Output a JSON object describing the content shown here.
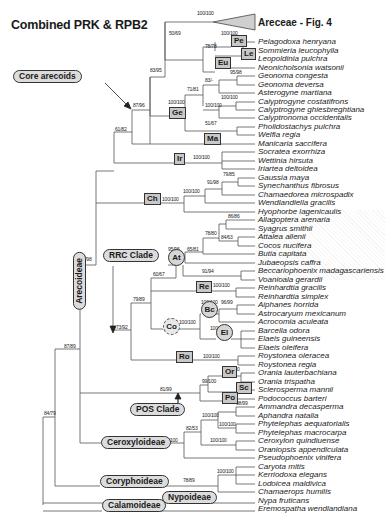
{
  "figure": {
    "title": "Combined PRK & RPB2",
    "collapsed_clade_label": "Areceae - Fig. 4",
    "collapsed_clade_support": "100/100"
  },
  "taxa": [
    {
      "name": "Pelagodoxa henryana",
      "y": 42
    },
    {
      "name": "Sommieria leucophylla",
      "y": 51
    },
    {
      "name": "Leopoldinia pulchra",
      "y": 59
    },
    {
      "name": "Neonicholsonia watsonii",
      "y": 68
    },
    {
      "name": "Geonoma congesta",
      "y": 76
    },
    {
      "name": "Geonoma deversa",
      "y": 85
    },
    {
      "name": "Asterogyne martiana",
      "y": 93
    },
    {
      "name": "Calyptrogyne costatifrons",
      "y": 102
    },
    {
      "name": "Calyptrogyne ghiesbreghtiana",
      "y": 110
    },
    {
      "name": "Calyptronoma occidentalis",
      "y": 118
    },
    {
      "name": "Pholidostachys pulchra",
      "y": 127
    },
    {
      "name": "Welfia regia",
      "y": 135
    },
    {
      "name": "Manicaria saccifera",
      "y": 144
    },
    {
      "name": "Socratea exorrhiza",
      "y": 152
    },
    {
      "name": "Wettinia hirsuta",
      "y": 161
    },
    {
      "name": "Iriartea deltoidea",
      "y": 169
    },
    {
      "name": "Gaussia maya",
      "y": 178
    },
    {
      "name": "Synechanthus fibrosus",
      "y": 186
    },
    {
      "name": "Chamaedorea microspadix",
      "y": 195
    },
    {
      "name": "Wendlandiella gracilis",
      "y": 203
    },
    {
      "name": "Hyophorbe lagenicaulis",
      "y": 212
    },
    {
      "name": "Allagoptera arenaria",
      "y": 220
    },
    {
      "name": "Syagrus smithii",
      "y": 229
    },
    {
      "name": "Attalea allenii",
      "y": 237
    },
    {
      "name": "Cocos nucifera",
      "y": 246
    },
    {
      "name": "Butia capitata",
      "y": 254
    },
    {
      "name": "Jubaeopsis caffra",
      "y": 263
    },
    {
      "name": "Beccariophoenix madagascariensis",
      "y": 271
    },
    {
      "name": "Voanioala gerardii",
      "y": 280
    },
    {
      "name": "Reinhardtia gracilis",
      "y": 288
    },
    {
      "name": "Reinhardtia simplex",
      "y": 297
    },
    {
      "name": "Aiphanes horrida",
      "y": 305
    },
    {
      "name": "Astrocaryum mexicanum",
      "y": 314
    },
    {
      "name": "Acrocomia aculeata",
      "y": 322
    },
    {
      "name": "Barcella odora",
      "y": 331
    },
    {
      "name": "Elaeis guineensis",
      "y": 339
    },
    {
      "name": "Elaeis oleifera",
      "y": 348
    },
    {
      "name": "Roystonea oleracea",
      "y": 356
    },
    {
      "name": "Roystonea regia",
      "y": 365
    },
    {
      "name": "Orania lauterbachiana",
      "y": 373
    },
    {
      "name": "Orania trispatha",
      "y": 382
    },
    {
      "name": "Sclerosperma mannii",
      "y": 390
    },
    {
      "name": "Podococcus barteri",
      "y": 399
    },
    {
      "name": "Ammandra decasperma",
      "y": 407
    },
    {
      "name": "Aphandra natalia",
      "y": 416
    },
    {
      "name": "Phytelephas aequatorialis",
      "y": 424
    },
    {
      "name": "Phytelephas macrocarpa",
      "y": 433
    },
    {
      "name": "Ceroxylon quindiuense",
      "y": 441
    },
    {
      "name": "Oraniopsis appendiculata",
      "y": 450
    },
    {
      "name": "Pseudophoenix vinifera",
      "y": 458
    },
    {
      "name": "Caryota mitis",
      "y": 467
    },
    {
      "name": "Kerriodoxa elegans",
      "y": 475
    },
    {
      "name": "Lodoicea maldivica",
      "y": 484
    },
    {
      "name": "Chamaerops humilis",
      "y": 492
    },
    {
      "name": "Nypa fruticans",
      "y": 501
    },
    {
      "name": "Eremospatha wendlandiana",
      "y": 509
    }
  ],
  "support_values": [
    {
      "text": "100/100",
      "x": 197,
      "y": 14
    },
    {
      "text": "50/69",
      "x": 169,
      "y": 34
    },
    {
      "text": "100/100",
      "x": 221,
      "y": 34
    },
    {
      "text": "78/78",
      "x": 205,
      "y": 47
    },
    {
      "text": "83/95",
      "x": 150,
      "y": 71
    },
    {
      "text": "95/98",
      "x": 230,
      "y": 73
    },
    {
      "text": "83/-",
      "x": 205,
      "y": 81
    },
    {
      "text": "71/81",
      "x": 187,
      "y": 90
    },
    {
      "text": "100/100",
      "x": 221,
      "y": 98
    },
    {
      "text": "100/100",
      "x": 168,
      "y": 103
    },
    {
      "text": "100/100",
      "x": 205,
      "y": 106
    },
    {
      "text": "87/96",
      "x": 133,
      "y": 106
    },
    {
      "text": "51/67",
      "x": 205,
      "y": 124
    },
    {
      "text": "61/82",
      "x": 115,
      "y": 130
    },
    {
      "text": "100/100",
      "x": 193,
      "y": 158
    },
    {
      "text": "79/85",
      "x": 223,
      "y": 175
    },
    {
      "text": "91/98",
      "x": 207,
      "y": 183
    },
    {
      "text": "100/100",
      "x": 183,
      "y": 192
    },
    {
      "text": "100/100",
      "x": 162,
      "y": 200
    },
    {
      "text": "86/86",
      "x": 228,
      "y": 217
    },
    {
      "text": "78/80",
      "x": 205,
      "y": 234
    },
    {
      "text": "84/63",
      "x": 221,
      "y": 238
    },
    {
      "text": "95/96",
      "x": 168,
      "y": 250
    },
    {
      "text": "65/81",
      "x": 187,
      "y": 250
    },
    {
      "text": "92/98",
      "x": 80,
      "y": 260
    },
    {
      "text": "91/94",
      "x": 202,
      "y": 272
    },
    {
      "text": "60/67",
      "x": 153,
      "y": 275
    },
    {
      "text": "100/100",
      "x": 213,
      "y": 286
    },
    {
      "text": "100/100",
      "x": 201,
      "y": 303
    },
    {
      "text": "96/99",
      "x": 221,
      "y": 303
    },
    {
      "text": "79/89",
      "x": 133,
      "y": 300
    },
    {
      "text": "100/100",
      "x": 179,
      "y": 323
    },
    {
      "text": "73/92",
      "x": 116,
      "y": 328
    },
    {
      "text": "100/100",
      "x": 210,
      "y": 329
    },
    {
      "text": "87/89",
      "x": 64,
      "y": 347
    },
    {
      "text": "100/100",
      "x": 203,
      "y": 357
    },
    {
      "text": "100/100",
      "x": 223,
      "y": 370
    },
    {
      "text": "81/99",
      "x": 160,
      "y": 390
    },
    {
      "text": "99/100",
      "x": 202,
      "y": 382
    },
    {
      "text": "98/99",
      "x": 236,
      "y": 404
    },
    {
      "text": "100/100",
      "x": 202,
      "y": 416
    },
    {
      "text": "84/79",
      "x": 44,
      "y": 414
    },
    {
      "text": "100/100",
      "x": 219,
      "y": 425
    },
    {
      "text": "82/53",
      "x": 186,
      "y": 429
    },
    {
      "text": "100/100",
      "x": 161,
      "y": 441
    },
    {
      "text": "100/100",
      "x": 210,
      "y": 441
    },
    {
      "text": "100/100",
      "x": 217,
      "y": 472
    },
    {
      "text": "78/89",
      "x": 183,
      "y": 481
    }
  ],
  "clade_boxes": [
    {
      "code": "Pe",
      "x": 231,
      "y": 40,
      "shape": "box"
    },
    {
      "code": "Le",
      "x": 241,
      "y": 53,
      "shape": "box"
    },
    {
      "code": "Eu",
      "x": 215,
      "y": 62,
      "shape": "box"
    },
    {
      "code": "Ge",
      "x": 169,
      "y": 112,
      "shape": "box"
    },
    {
      "code": "Ma",
      "x": 204,
      "y": 138,
      "shape": "box"
    },
    {
      "code": "Ir",
      "x": 174,
      "y": 158,
      "shape": "box"
    },
    {
      "code": "Ch",
      "x": 144,
      "y": 198,
      "shape": "box"
    },
    {
      "code": "At",
      "x": 168,
      "y": 257,
      "shape": "circle"
    },
    {
      "code": "Re",
      "x": 196,
      "y": 286,
      "shape": "box"
    },
    {
      "code": "Bc",
      "x": 201,
      "y": 309,
      "shape": "circle"
    },
    {
      "code": "Co",
      "x": 163,
      "y": 326,
      "shape": "circle-dashed"
    },
    {
      "code": "El",
      "x": 216,
      "y": 332,
      "shape": "circle"
    },
    {
      "code": "Ro",
      "x": 176,
      "y": 356,
      "shape": "box"
    },
    {
      "code": "Or",
      "x": 222,
      "y": 371,
      "shape": "box"
    },
    {
      "code": "Sc",
      "x": 236,
      "y": 387,
      "shape": "box"
    },
    {
      "code": "Po",
      "x": 222,
      "y": 397,
      "shape": "box"
    }
  ],
  "clade_labels": [
    {
      "label": "Core arecoids",
      "x": 13,
      "y": 76
    },
    {
      "label": "RRC Clade",
      "x": 103,
      "y": 255
    },
    {
      "label": "POS Clade",
      "x": 130,
      "y": 409
    },
    {
      "label": "Ceroxyloideae",
      "x": 101,
      "y": 442
    },
    {
      "label": "Coryphoideae",
      "x": 100,
      "y": 481
    },
    {
      "label": "Nypoideae",
      "x": 162,
      "y": 497
    },
    {
      "label": "Calamoideae",
      "x": 102,
      "y": 505
    }
  ],
  "vertical_clade_label": {
    "label": "Arecoideae",
    "x": 73,
    "y": 282
  },
  "colors": {
    "line": "#555555",
    "box_fill": "#c8c8c8",
    "pill_fill": "#dcdcdc",
    "triangle_fill": "#cfcfcf"
  }
}
